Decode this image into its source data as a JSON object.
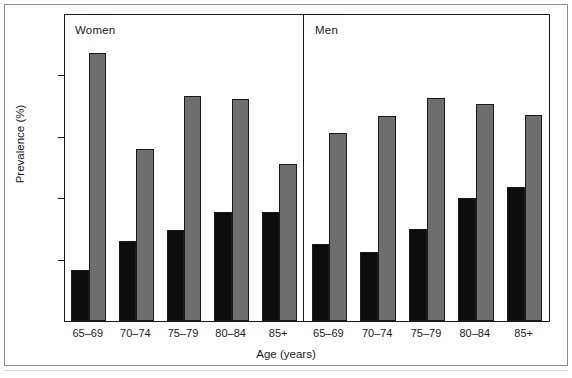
{
  "figure": {
    "y_axis_title": "Prevalence (%)",
    "x_axis_title": "Age (years)",
    "panel_women_title": "Women",
    "panel_men_title": "Men",
    "y_ticks": [
      "0",
      "20",
      "40",
      "60",
      "80",
      "100"
    ],
    "x_ticks_women": [
      "65–69",
      "70–74",
      "75–79",
      "80–84",
      "85+"
    ],
    "x_ticks_men": [
      "65–69",
      "70–74",
      "75–79",
      "80–84",
      "85+"
    ],
    "colors": {
      "series_black": "#0d0d0d",
      "series_gray": "#6e6e6e",
      "axis": "#1a1a1a",
      "background": "#ffffff",
      "frame": "#8d8d8d"
    }
  },
  "chart_data": {
    "type": "bar",
    "title": "",
    "xlabel": "Age (years)",
    "ylabel": "Prevalence (%)",
    "ylim": [
      0,
      100
    ],
    "yticks": [
      0,
      20,
      40,
      60,
      80,
      100
    ],
    "grid": false,
    "legend_position": "none",
    "panels": [
      {
        "name": "Women",
        "categories": [
          "65–69",
          "70–74",
          "75–79",
          "80–84",
          "85+"
        ],
        "series": [
          {
            "name": "black",
            "values": [
              16.5,
              26.0,
              29.5,
              35.5,
              35.5
            ]
          },
          {
            "name": "gray",
            "values": [
              87.0,
              56.0,
              73.0,
              72.0,
              51.0
            ]
          }
        ]
      },
      {
        "name": "Men",
        "categories": [
          "65–69",
          "70–74",
          "75–79",
          "80–84",
          "85+"
        ],
        "series": [
          {
            "name": "black",
            "values": [
              25.0,
              22.5,
              30.0,
              40.0,
              43.5
            ]
          },
          {
            "name": "gray",
            "values": [
              61.0,
              66.5,
              72.5,
              70.5,
              67.0
            ]
          }
        ]
      }
    ]
  }
}
